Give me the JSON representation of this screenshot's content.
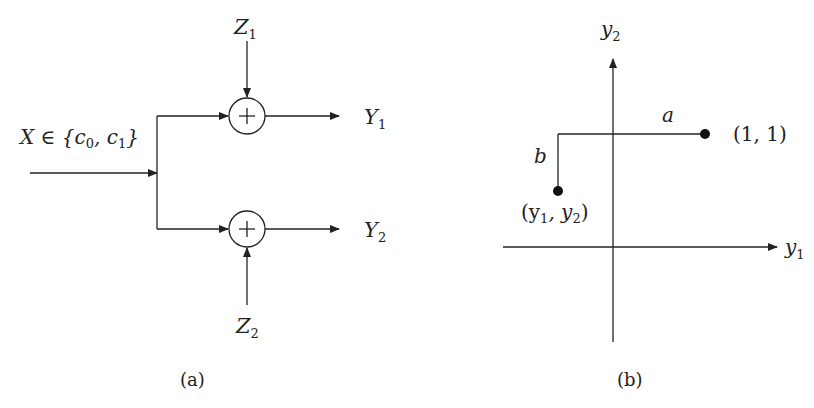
{
  "panel_a": {
    "caption": "(a)",
    "input_label": {
      "main": "X ∈ {c",
      "sub0": "0",
      "mid": ", c",
      "sub1": "1",
      "end": "}"
    },
    "noise_top": {
      "main": "Z",
      "sub": "1"
    },
    "noise_bottom": {
      "main": "Z",
      "sub": "2"
    },
    "output_top": {
      "main": "Y",
      "sub": "1"
    },
    "output_bottom": {
      "main": "Y",
      "sub": "2"
    },
    "adder_symbol": "+"
  },
  "panel_b": {
    "caption": "(b)",
    "x_axis": {
      "main": "y",
      "sub": "1"
    },
    "y_axis": {
      "main": "y",
      "sub": "2"
    },
    "point_one": "(1, 1)",
    "point_y": {
      "open": "(y",
      "sub1": "1",
      "mid": ", y",
      "sub2": "2",
      "close": ")"
    },
    "dist_a": "a",
    "dist_b": "b"
  },
  "colors": {
    "stroke": "#222222",
    "background": "#ffffff"
  }
}
